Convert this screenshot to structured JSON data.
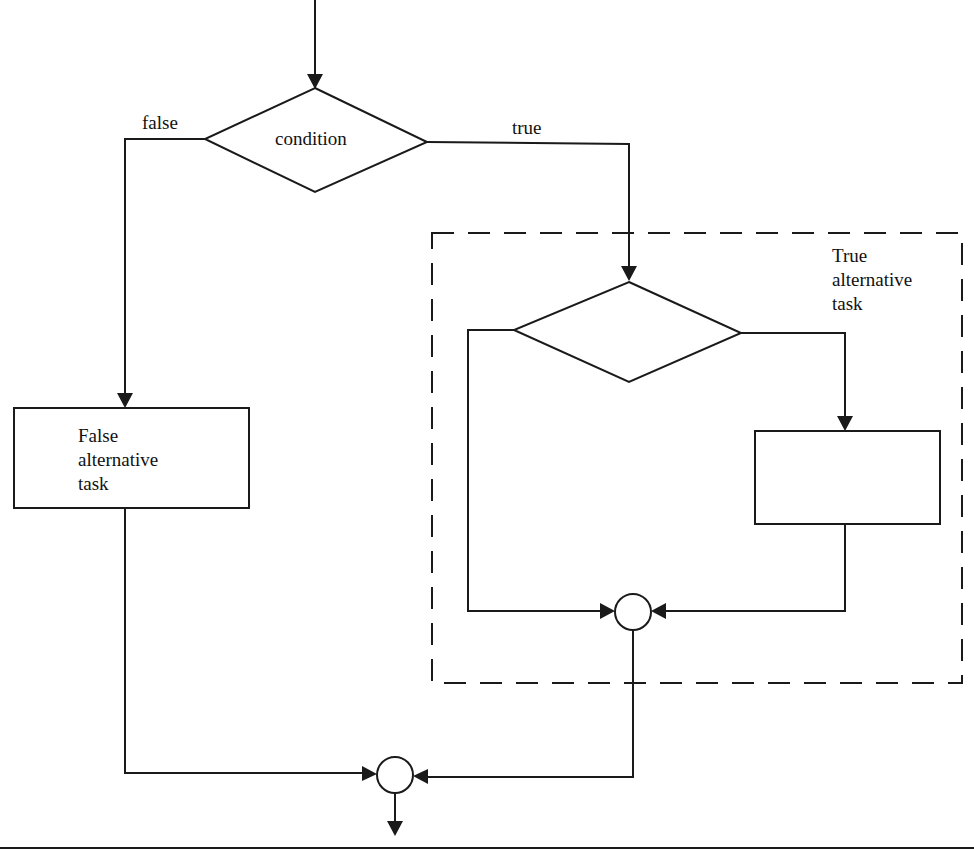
{
  "diagram": {
    "colors": {
      "line": "#1a1a1a",
      "background": "#ffffff"
    },
    "labels": {
      "condition": "condition",
      "false_branch": "false",
      "true_branch": "true",
      "false_task_line1": "False",
      "false_task_line2": "alternative",
      "false_task_line3": "task",
      "true_group_line1": "True",
      "true_group_line2": "alternative",
      "true_group_line3": "task"
    },
    "nodes": [
      {
        "id": "entry-arrow",
        "type": "arrow",
        "from": [
          315,
          0
        ],
        "to": [
          315,
          88
        ]
      },
      {
        "id": "outer-condition",
        "type": "decision",
        "label": "condition",
        "top": [
          315,
          88
        ],
        "left": [
          205,
          139
        ],
        "right": [
          427,
          142
        ],
        "bottom": [
          315,
          192
        ]
      },
      {
        "id": "false-task",
        "type": "process",
        "label": "False alternative task",
        "x": 14,
        "y": 408,
        "w": 235,
        "h": 100
      },
      {
        "id": "true-group",
        "type": "dashed-group",
        "label": "True alternative task",
        "x": 432,
        "y": 233,
        "w": 530,
        "h": 450
      },
      {
        "id": "inner-condition",
        "type": "decision",
        "label": "",
        "top": [
          629,
          282
        ],
        "left": [
          514,
          330
        ],
        "right": [
          741,
          333
        ],
        "bottom": [
          629,
          382
        ]
      },
      {
        "id": "inner-task",
        "type": "process",
        "label": "",
        "x": 755,
        "y": 431,
        "w": 185,
        "h": 93
      },
      {
        "id": "inner-merge",
        "type": "connector",
        "cx": 633,
        "cy": 612,
        "r": 18
      },
      {
        "id": "outer-merge",
        "type": "connector",
        "cx": 395,
        "cy": 775,
        "r": 18
      },
      {
        "id": "exit-arrow",
        "type": "arrow",
        "from": [
          395,
          795
        ],
        "to": [
          395,
          835
        ]
      }
    ],
    "edges": [
      {
        "from": "outer-condition",
        "to": "false-task",
        "label": "false"
      },
      {
        "from": "outer-condition",
        "to": "inner-condition",
        "label": "true"
      },
      {
        "from": "inner-condition",
        "to": "inner-task",
        "label": ""
      },
      {
        "from": "inner-condition",
        "to": "inner-merge",
        "label": ""
      },
      {
        "from": "inner-task",
        "to": "inner-merge",
        "label": ""
      },
      {
        "from": "false-task",
        "to": "outer-merge",
        "label": ""
      },
      {
        "from": "inner-merge",
        "to": "outer-merge",
        "label": ""
      },
      {
        "from": "outer-merge",
        "to": "exit",
        "label": ""
      }
    ]
  }
}
